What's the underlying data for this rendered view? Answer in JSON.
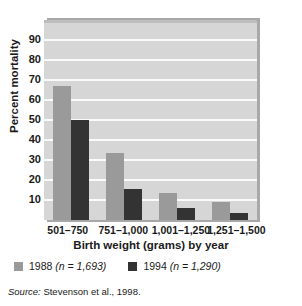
{
  "chart_data": {
    "type": "bar",
    "title": "",
    "xlabel": "Birth weight (grams) by year",
    "ylabel": "Percent mortality",
    "categories": [
      "501–750",
      "751–1,000",
      "1,001–1,250",
      "1,251–1,500"
    ],
    "series": [
      {
        "name": "1988 (n = 1,693)",
        "short_name": "1988",
        "n": "1,693",
        "color": "#9a9a9a",
        "values": [
          67,
          33.5,
          13.5,
          9
        ]
      },
      {
        "name": "1994 (n = 1,290)",
        "short_name": "1994",
        "n": "1,290",
        "color": "#333333",
        "values": [
          50,
          15.5,
          6,
          3.5
        ]
      }
    ],
    "yticks": [
      90,
      80,
      70,
      60,
      50,
      40,
      30,
      20,
      10
    ],
    "ylim": [
      0,
      100
    ],
    "grid": true,
    "legend_position": "bottom-left",
    "plot_background": "#d6d6d6",
    "gridline_color": "#fbfbfb"
  },
  "legend": {
    "items": [
      {
        "label_year": "1988",
        "label_n": "(n = 1,693)"
      },
      {
        "label_year": "1994",
        "label_n": "(n = 1,290)"
      }
    ]
  },
  "source": {
    "label": "Source:",
    "text": "Stevenson et al., 1998."
  }
}
